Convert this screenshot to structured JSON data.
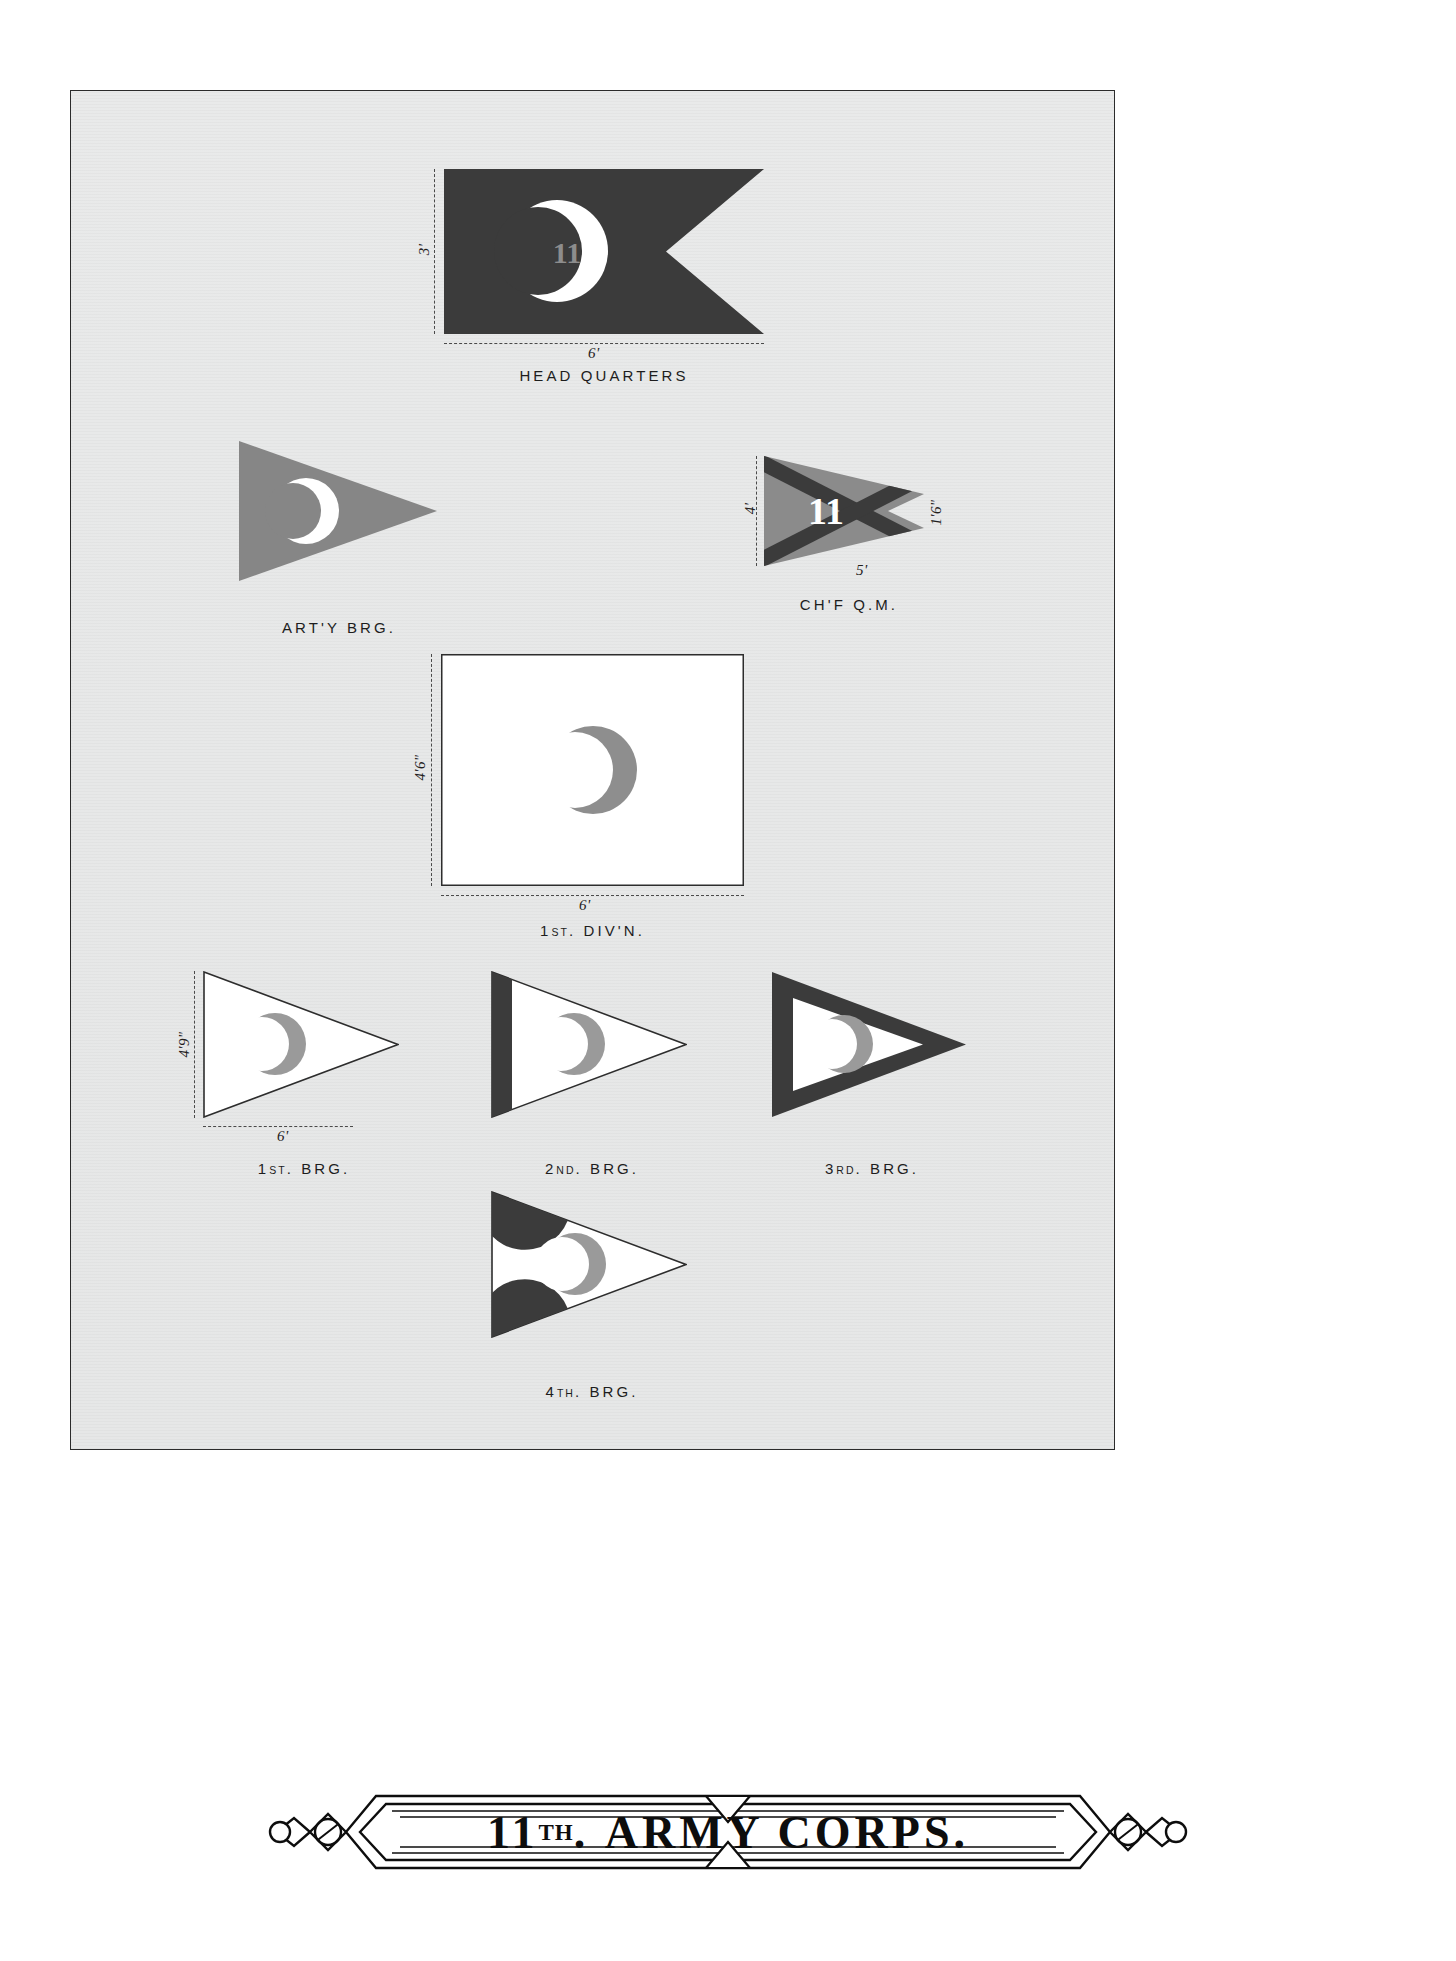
{
  "plate": {
    "corps_number": "11",
    "title_main": "ARMY CORPS.",
    "title_ordinal_num": "11",
    "title_ordinal_suffix": "TH",
    "background_color": "#e7e8e8",
    "ink_color": "#3a3a3a",
    "field_gray": "#868686",
    "white": "#ffffff"
  },
  "figures": [
    {
      "id": "head-quarters",
      "caption": "HEAD QUARTERS",
      "shape": "swallowtail-rectangle",
      "field": "dark",
      "device": "white-crescent-with-number",
      "device_number": "11",
      "dim_height": "3'",
      "dim_width": "6'"
    },
    {
      "id": "artillery-brigade",
      "caption": "ART'Y BRG.",
      "shape": "triangle",
      "field": "gray",
      "device": "white-crescent",
      "dim_height": "",
      "dim_width": ""
    },
    {
      "id": "chief-quartermaster",
      "caption": "CH'F Q.M.",
      "shape": "swallowtail-triangle",
      "field": "gray",
      "device": "dark-saltire-with-white-number",
      "device_number": "11",
      "dim_height": "4'",
      "dim_width": "5'",
      "dim_notch": "1'6\""
    },
    {
      "id": "first-division",
      "caption": "1st. DIV'N.",
      "caption_lead": "1",
      "caption_sup": "st",
      "caption_tail": ". DIV'N.",
      "shape": "rectangle",
      "field": "white",
      "device": "gray-crescent",
      "dim_height": "4'6\"",
      "dim_width": "6'"
    },
    {
      "id": "first-brigade",
      "caption": "1st. BRG.",
      "caption_lead": "1",
      "caption_sup": "st",
      "caption_tail": ". BRG.",
      "shape": "triangle",
      "field": "white",
      "device": "gray-crescent",
      "dim_height": "4'9\"",
      "dim_width": "6'"
    },
    {
      "id": "second-brigade",
      "caption": "2nd. BRG.",
      "caption_lead": "2",
      "caption_sup": "nd",
      "caption_tail": ". BRG.",
      "shape": "triangle",
      "field": "white-with-dark-hoist-stripe",
      "device": "gray-crescent"
    },
    {
      "id": "third-brigade",
      "caption": "3rd. BRG.",
      "caption_lead": "3",
      "caption_sup": "rd",
      "caption_tail": ". BRG.",
      "shape": "triangle",
      "field": "white-with-dark-border",
      "device": "gray-crescent"
    },
    {
      "id": "fourth-brigade",
      "caption": "4th. BRG.",
      "caption_lead": "4",
      "caption_sup": "th",
      "caption_tail": ". BRG.",
      "shape": "triangle",
      "field": "white-with-dark-corner-wedges",
      "device": "gray-crescent"
    }
  ],
  "labels": {
    "hq_h": "3'",
    "hq_w": "6'",
    "qm_h": "4'",
    "qm_w": "5'",
    "qm_notch": "1'6\"",
    "div_h": "4'6\"",
    "div_w": "6'",
    "brg_h": "4'9\"",
    "brg_w": "6'"
  },
  "captions": {
    "head_quarters": "HEAD QUARTERS",
    "artillery": "ART'Y BRG.",
    "quartermaster": "CH'F Q.M.",
    "division1_lead": "1",
    "division1_sup": "ST",
    "division1_tail": ". DIV'N.",
    "brigade1_lead": "1",
    "brigade1_sup": "ST",
    "brigade1_tail": ". BRG.",
    "brigade2_lead": "2",
    "brigade2_sup": "ND",
    "brigade2_tail": ". BRG.",
    "brigade3_lead": "3",
    "brigade3_sup": "RD",
    "brigade3_tail": ". BRG.",
    "brigade4_lead": "4",
    "brigade4_sup": "TH",
    "brigade4_tail": ". BRG."
  }
}
